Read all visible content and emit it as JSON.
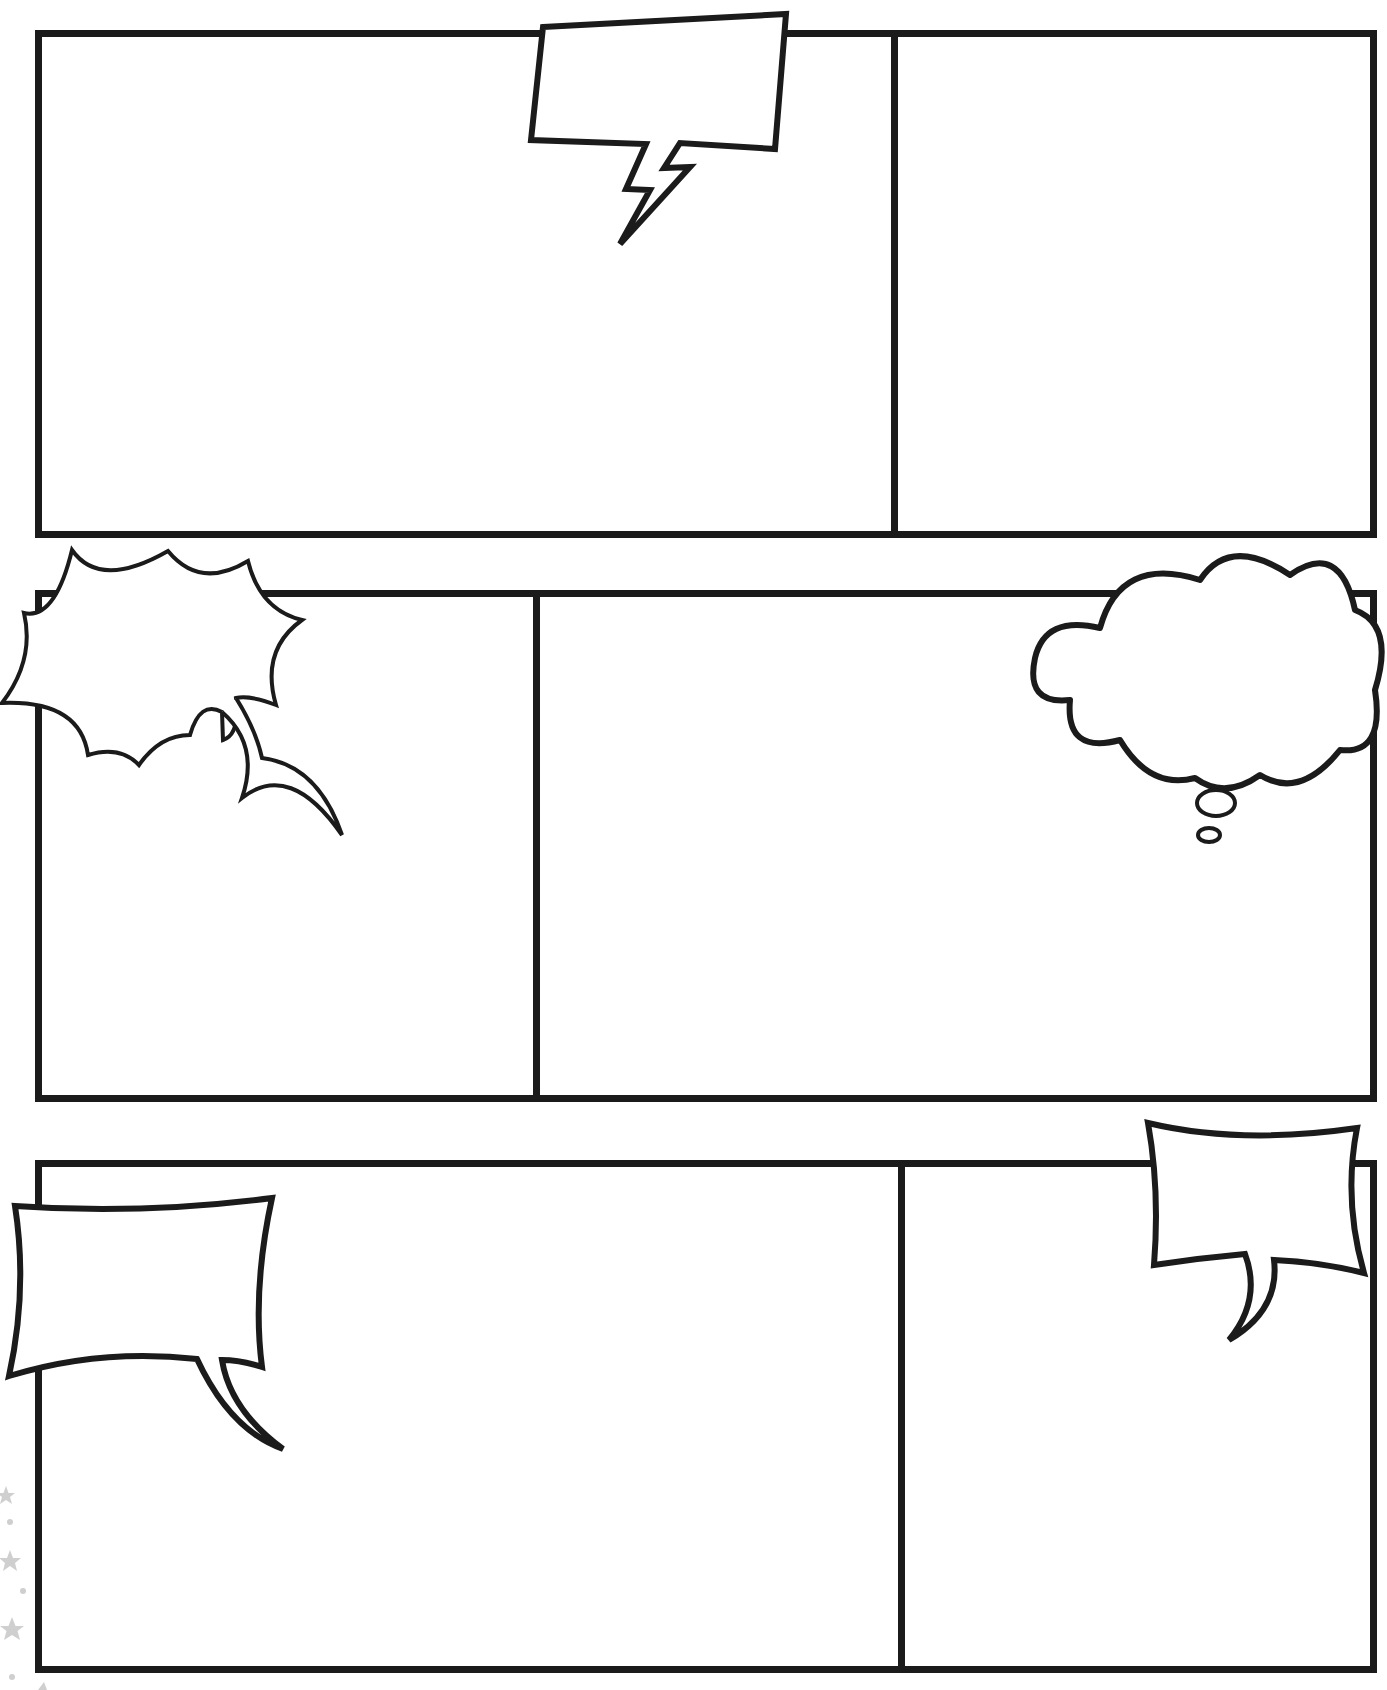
{
  "page": {
    "background": "#ffffff",
    "ink_color": "#1b1b1b",
    "decoration_color": "#c8c8c8"
  },
  "rows": [
    {
      "name": "row-1",
      "panels": [
        {
          "id": "panel-1",
          "x": 35,
          "y": 30,
          "w": 863,
          "h": 508,
          "label": ""
        },
        {
          "id": "panel-2",
          "x": 891,
          "y": 30,
          "w": 486,
          "h": 508,
          "label": ""
        }
      ]
    },
    {
      "name": "row-2",
      "panels": [
        {
          "id": "panel-3",
          "x": 35,
          "y": 590,
          "w": 505,
          "h": 512,
          "label": ""
        },
        {
          "id": "panel-4",
          "x": 533,
          "y": 590,
          "w": 844,
          "h": 512,
          "label": ""
        }
      ]
    },
    {
      "name": "row-3",
      "panels": [
        {
          "id": "panel-5",
          "x": 35,
          "y": 1160,
          "w": 870,
          "h": 513,
          "label": ""
        },
        {
          "id": "panel-6",
          "x": 898,
          "y": 1160,
          "w": 479,
          "h": 513,
          "label": ""
        }
      ]
    }
  ],
  "bubbles": [
    {
      "id": "lightning-bubble",
      "type": "shout-zigzag",
      "text": ""
    },
    {
      "id": "burst-bubble",
      "type": "explosion",
      "text": ""
    },
    {
      "id": "thought-bubble",
      "type": "thought-cloud",
      "text": ""
    },
    {
      "id": "speech-bubble-left",
      "type": "speech-rect",
      "text": ""
    },
    {
      "id": "speech-bubble-right",
      "type": "speech-rect",
      "text": ""
    }
  ],
  "decorations": {
    "stars": [
      {
        "x": 6,
        "y": 1496,
        "r": 8
      },
      {
        "x": 10,
        "y": 1562,
        "r": 10
      },
      {
        "x": 12,
        "y": 1630,
        "r": 11
      }
    ],
    "dots": [
      {
        "x": 10,
        "y": 1522,
        "r": 3
      },
      {
        "x": 23,
        "y": 1591,
        "r": 3
      },
      {
        "x": 12,
        "y": 1677,
        "r": 3
      }
    ]
  }
}
